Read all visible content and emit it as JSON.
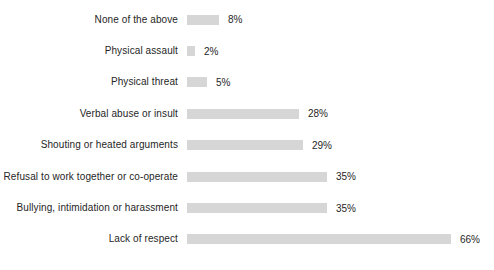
{
  "chart_data": {
    "type": "bar",
    "orientation": "horizontal",
    "title": "",
    "xlabel": "",
    "ylabel": "",
    "xlim": [
      0,
      100
    ],
    "grid": false,
    "legend": false,
    "bar_color": "#d6d6d6",
    "text_color": "#262626",
    "background_color": "#ffffff",
    "categories": [
      "None of the above",
      "Physical assault",
      "Physical threat",
      "Verbal abuse or insult",
      "Shouting or heated arguments",
      "Refusal to work together or co-operate",
      "Bullying, intimidation or harassment",
      "Lack of respect"
    ],
    "values": [
      8,
      2,
      5,
      28,
      29,
      35,
      35,
      66
    ],
    "value_labels": [
      "8%",
      "2%",
      "5%",
      "28%",
      "29%",
      "35%",
      "35%",
      "66%"
    ]
  }
}
